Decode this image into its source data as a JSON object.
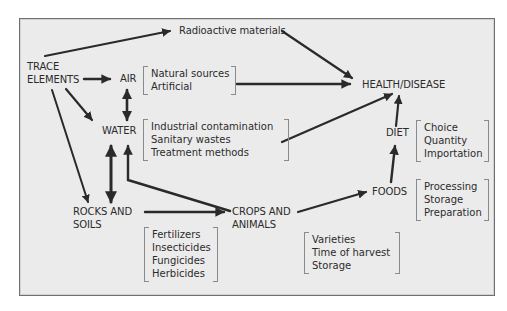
{
  "diagram": {
    "nodes": {
      "trace_elements": [
        "TRACE",
        "ELEMENTS"
      ],
      "radioactive": "Radioactive materials",
      "air": "AIR",
      "water": "WATER",
      "rocks_soils": [
        "ROCKS AND",
        "SOILS"
      ],
      "crops_animals": [
        "CROPS AND",
        "ANIMALS"
      ],
      "foods": "FOODS",
      "diet": "DIET",
      "health": "HEALTH/DISEASE"
    },
    "lists": {
      "air_sources": [
        "Natural sources",
        "Artificial"
      ],
      "water_sources": [
        "Industrial contamination",
        "Sanitary wastes",
        "Treatment methods"
      ],
      "soil_inputs": [
        "Fertilizers",
        "Insecticides",
        "Fungicides",
        "Herbicides"
      ],
      "crop_factors": [
        "Varieties",
        "Time of harvest",
        "Storage"
      ],
      "diet_factors": [
        "Choice",
        "Quantity",
        "Importation"
      ],
      "food_factors": [
        "Processing",
        "Storage",
        "Preparation"
      ]
    },
    "edges": [
      {
        "from": "TRACE ELEMENTS",
        "to": "Radioactive materials"
      },
      {
        "from": "TRACE ELEMENTS",
        "to": "AIR"
      },
      {
        "from": "TRACE ELEMENTS",
        "to": "WATER"
      },
      {
        "from": "TRACE ELEMENTS",
        "to": "ROCKS AND SOILS"
      },
      {
        "from": "AIR",
        "to": "WATER",
        "bidirectional": true
      },
      {
        "from": "WATER",
        "to": "ROCKS AND SOILS",
        "bidirectional": true
      },
      {
        "from": "CROPS AND ANIMALS",
        "to": "WATER"
      },
      {
        "from": "ROCKS AND SOILS",
        "to": "CROPS AND ANIMALS"
      },
      {
        "from": "CROPS AND ANIMALS",
        "to": "FOODS"
      },
      {
        "from": "FOODS",
        "to": "DIET"
      },
      {
        "from": "DIET",
        "to": "HEALTH/DISEASE"
      },
      {
        "from": "Radioactive materials",
        "to": "HEALTH/DISEASE"
      },
      {
        "from": "AIR",
        "to": "HEALTH/DISEASE"
      },
      {
        "from": "WATER",
        "to": "HEALTH/DISEASE"
      }
    ],
    "colors": {
      "background": "#ebebeb",
      "arrow": "#2a2a2a",
      "border": "#6f6f6f"
    }
  }
}
